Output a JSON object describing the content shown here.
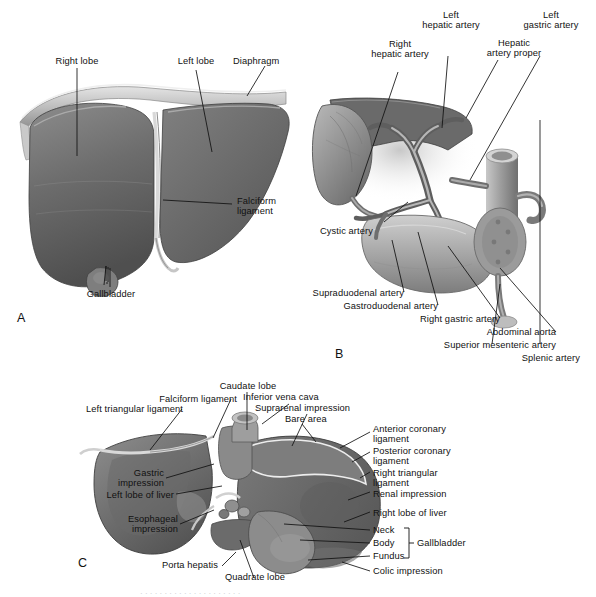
{
  "figure": {
    "type": "anatomical-illustration",
    "grayscale": true,
    "colors": {
      "background": "#ffffff",
      "liver_mid": "#6f6f6f",
      "liver_dark": "#4a4a4a",
      "liver_light": "#9a9a9a",
      "serosa_light": "#cfcfcf",
      "leader_line": "#111111",
      "text": "#111111"
    },
    "panels": [
      {
        "letter": "A",
        "title": "Anterior (diaphragmatic) surface of the liver"
      },
      {
        "letter": "B",
        "title": "Arterial supply of the liver, gallbladder and duodenum"
      },
      {
        "letter": "C",
        "title": "Visceral (inferior) surface of the liver"
      }
    ],
    "caption_clipped": "· · · · · · · · · · · · · · · · · · · · ·"
  },
  "panel_a": {
    "letter": "A",
    "labels": [
      {
        "id": "right-lobe",
        "text": "Right lobe"
      },
      {
        "id": "left-lobe",
        "text": "Left lobe"
      },
      {
        "id": "diaphragm",
        "text": "Diaphragm"
      },
      {
        "id": "falciform-ligament",
        "text": "Falciform\nligament"
      },
      {
        "id": "gallbladder",
        "text": "Gallbladder"
      }
    ]
  },
  "panel_b": {
    "letter": "B",
    "labels": [
      {
        "id": "right-hepatic-artery",
        "text": "Right\nhepatic artery"
      },
      {
        "id": "left-hepatic-artery",
        "text": "Left\nhepatic artery"
      },
      {
        "id": "hepatic-artery-proper",
        "text": "Hepatic\nartery proper"
      },
      {
        "id": "left-gastric-artery",
        "text": "Left\ngastric artery"
      },
      {
        "id": "cystic-artery",
        "text": "Cystic artery"
      },
      {
        "id": "supraduodenal-artery",
        "text": "Supraduodenal artery"
      },
      {
        "id": "gastroduodenal-artery",
        "text": "Gastroduodenal artery"
      },
      {
        "id": "right-gastric-artery",
        "text": "Right gastric artery"
      },
      {
        "id": "abdominal-aorta",
        "text": "Abdominal aorta"
      },
      {
        "id": "superior-mesenteric-artery",
        "text": "Superior mesenteric artery"
      },
      {
        "id": "splenic-artery",
        "text": "Splenic artery"
      }
    ]
  },
  "panel_c": {
    "letter": "C",
    "labels": [
      {
        "id": "caudate-lobe",
        "text": "Caudate lobe"
      },
      {
        "id": "falciform-ligament",
        "text": "Falciform ligament"
      },
      {
        "id": "left-triangular-ligament",
        "text": "Left triangular ligament"
      },
      {
        "id": "inferior-vena-cava",
        "text": "Inferior vena cava"
      },
      {
        "id": "suprarenal-impression",
        "text": "Suprarenal impression"
      },
      {
        "id": "bare-area",
        "text": "Bare area"
      },
      {
        "id": "anterior-coronary-ligament",
        "text": "Anterior coronary\nligament"
      },
      {
        "id": "posterior-coronary-ligament",
        "text": "Posterior coronary\nligament"
      },
      {
        "id": "right-triangular-ligament",
        "text": "Right triangular\nligament"
      },
      {
        "id": "renal-impression",
        "text": "Renal impression"
      },
      {
        "id": "right-lobe-of-liver",
        "text": "Right lobe of liver"
      },
      {
        "id": "neck",
        "text": "Neck"
      },
      {
        "id": "body",
        "text": "Body"
      },
      {
        "id": "fundus",
        "text": "Fundus"
      },
      {
        "id": "gallbladder-bracket",
        "text": "Gallbladder"
      },
      {
        "id": "colic-impression",
        "text": "Colic impression"
      },
      {
        "id": "gastric-impression",
        "text": "Gastric\nimpression"
      },
      {
        "id": "left-lobe-of-liver",
        "text": "Left lobe of liver"
      },
      {
        "id": "esophageal-impression",
        "text": "Esophageal\nimpression"
      },
      {
        "id": "porta-hepatis",
        "text": "Porta hepatis"
      },
      {
        "id": "quadrate-lobe",
        "text": "Quadrate lobe"
      }
    ]
  }
}
